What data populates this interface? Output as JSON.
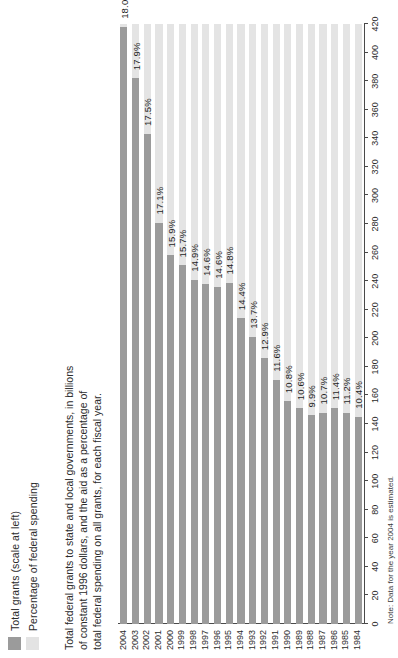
{
  "legend": {
    "items": [
      {
        "label": "Total grants (scale at left)",
        "color": "#9b9b9b",
        "swatch": "dark-swatch"
      },
      {
        "label": "Percentage of federal spending",
        "color": "#e3e3e3",
        "swatch": "light-swatch"
      }
    ]
  },
  "description": {
    "line1": "Total federal grants to state and local governments, in billions",
    "line2": "of constant 1996 dollars, and the aid as a percentage of",
    "line3": "total federal spending on all grants, for each fiscal year."
  },
  "note": {
    "text": "Note: Data for the year 2004 is estimated."
  },
  "chart_data": {
    "type": "bar",
    "title": "Total federal grants to state and local governments",
    "xlabel": "",
    "ylabel": "Billions of constant 1996 dollars",
    "orientation": "horizontal",
    "grid": true,
    "legend_position": "top-left",
    "ylim": [
      0,
      420
    ],
    "axis_ticks": [
      0,
      20,
      40,
      60,
      80,
      100,
      120,
      140,
      160,
      180,
      200,
      220,
      240,
      260,
      280,
      300,
      320,
      340,
      360,
      380,
      400,
      420
    ],
    "categories": [
      "2004",
      "2003",
      "2002",
      "2001",
      "2000",
      "1999",
      "1998",
      "1997",
      "1996",
      "1995",
      "1994",
      "1993",
      "1992",
      "1991",
      "1990",
      "1989",
      "1988",
      "1987",
      "1986",
      "1985",
      "1984"
    ],
    "series": [
      {
        "name": "Total grants (scale at left)",
        "color": "#9b9b9b",
        "values": [
          418,
          382,
          343,
          281,
          258,
          251,
          241,
          238,
          236,
          239,
          214,
          201,
          186,
          171,
          156,
          151,
          146,
          148,
          151,
          148,
          145
        ]
      },
      {
        "name": "Percentage of federal spending",
        "color": "#e3e3e3",
        "values": [
          18.0,
          17.9,
          17.5,
          17.1,
          15.9,
          15.7,
          14.9,
          14.6,
          14.6,
          14.8,
          14.4,
          13.7,
          12.9,
          11.6,
          10.8,
          10.6,
          9.9,
          10.7,
          11.4,
          11.2,
          10.4
        ],
        "labels": [
          "18.0%",
          "17.9%",
          "17.5%",
          "17.1%",
          "15.9%",
          "15.7%",
          "14.9%",
          "14.6%",
          "14.6%",
          "14.8%",
          "14.4%",
          "13.7%",
          "12.9%",
          "11.6%",
          "10.8%",
          "10.6%",
          "9.9%",
          "10.7%",
          "11.4%",
          "11.2%",
          "10.4%"
        ]
      }
    ]
  }
}
